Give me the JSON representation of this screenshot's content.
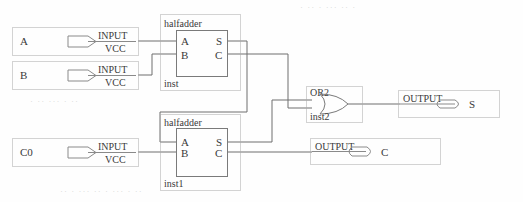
{
  "diagram": {
    "type": "logic-schematic",
    "colors": {
      "wire": "#6e6e6e",
      "solid_border": "#7a7a7a",
      "dotted_border": "#a8a8a8",
      "text": "#3a3a3a",
      "background": "#fefefe"
    }
  },
  "inputs": [
    {
      "name": "input-a",
      "signal": "A",
      "pin_type": "INPUT",
      "power": "VCC"
    },
    {
      "name": "input-b",
      "signal": "B",
      "pin_type": "INPUT",
      "power": "VCC"
    },
    {
      "name": "input-c0",
      "signal": "C0",
      "pin_type": "INPUT",
      "power": "VCC"
    }
  ],
  "components": [
    {
      "name": "halfadder-inst",
      "type": "halfadder",
      "instance": "inst",
      "in_ports": [
        "A",
        "B"
      ],
      "out_ports": [
        "S",
        "C"
      ]
    },
    {
      "name": "halfadder-inst1",
      "type": "halfadder",
      "instance": "inst1",
      "in_ports": [
        "A",
        "B"
      ],
      "out_ports": [
        "S",
        "C"
      ]
    },
    {
      "name": "or2-inst2",
      "type": "OR2",
      "instance": "inst2",
      "in_ports": [
        "",
        ""
      ],
      "out_ports": [
        ""
      ]
    }
  ],
  "outputs": [
    {
      "name": "output-s",
      "signal": "S",
      "pin_type": "OUTPUT"
    },
    {
      "name": "output-c",
      "signal": "C",
      "pin_type": "OUTPUT"
    }
  ],
  "bleed_text": {
    "top_right": "·  ··  · ··· ··  ·",
    "mid_left": "· ·· ··· · ··",
    "bottom": "·· · ··· ·· ·  ··· · ··"
  }
}
